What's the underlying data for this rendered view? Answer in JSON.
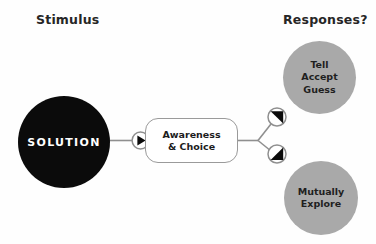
{
  "diagram": {
    "headings": {
      "left": "Stimulus",
      "right": "Responses?"
    },
    "nodes": {
      "solution": {
        "label": "SOLUTION",
        "shape": "circle",
        "fill": "#0b0b0b",
        "text_color": "#ffffff"
      },
      "awareness_choice": {
        "line1": "Awareness",
        "line2": "& Choice",
        "shape": "rounded-rectangle",
        "fill": "#ffffff",
        "border_color": "#9a9a9a"
      },
      "tell_accept_guess": {
        "line1": "Tell",
        "line2": "Accept",
        "line3": "Guess",
        "shape": "circle",
        "fill": "#a9a9a9",
        "text_color": "#1f1f1f"
      },
      "mutually_explore": {
        "line1": "Mutually",
        "line2": "Explore",
        "shape": "circle",
        "fill": "#a9a9a9",
        "text_color": "#1f1f1f"
      }
    },
    "markers": [
      {
        "name": "input-arrow-marker",
        "direction": "right"
      },
      {
        "name": "upper-branch-arrow-marker",
        "direction": "up-right"
      },
      {
        "name": "lower-branch-arrow-marker",
        "direction": "down-right"
      }
    ],
    "colors": {
      "background": "#fefefe",
      "wire": "#8f8f8f",
      "marker_fill": "#ffffff",
      "marker_border": "#8f8f8f",
      "marker_glyph": "#0b0b0b"
    }
  }
}
